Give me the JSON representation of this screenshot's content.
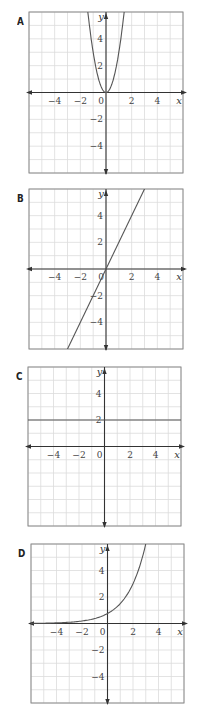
{
  "chart_data": [
    {
      "type": "line",
      "label": "A",
      "equation": "y = 3x^2",
      "xlabel": "x",
      "ylabel": "y",
      "xlim": [
        -6,
        6
      ],
      "ylim": [
        -6,
        6
      ],
      "xticks": [
        -4,
        -2,
        0,
        2,
        4
      ],
      "yticks": [
        4,
        2,
        -2,
        -4
      ],
      "grid": true,
      "series": [
        {
          "name": "curve",
          "kind": "parabola",
          "a": 3,
          "points": [
            [
              -1.41,
              6
            ],
            [
              -1,
              3
            ],
            [
              0,
              0
            ],
            [
              1,
              3
            ],
            [
              1.41,
              6
            ]
          ]
        }
      ]
    },
    {
      "type": "line",
      "label": "B",
      "equation": "y = 2x",
      "xlabel": "x",
      "ylabel": "y",
      "xlim": [
        -6,
        6
      ],
      "ylim": [
        -6,
        6
      ],
      "xticks": [
        -4,
        -2,
        0,
        2,
        4
      ],
      "yticks": [
        4,
        2,
        -2,
        -4
      ],
      "grid": true,
      "series": [
        {
          "name": "line",
          "kind": "linear",
          "m": 2,
          "c": 0,
          "points": [
            [
              -3,
              -6
            ],
            [
              0,
              0
            ],
            [
              3,
              6
            ]
          ]
        }
      ]
    },
    {
      "type": "line",
      "label": "C",
      "equation": "y = 2",
      "xlabel": "x",
      "ylabel": "y",
      "xlim": [
        -6,
        6
      ],
      "ylim": [
        -6,
        6
      ],
      "xticks": [
        -4,
        -2,
        0,
        2,
        4
      ],
      "yticks": [
        4,
        2
      ],
      "grid": true,
      "series": [
        {
          "name": "line",
          "kind": "linear",
          "m": 0,
          "c": 2,
          "points": [
            [
              -6,
              2
            ],
            [
              6,
              2
            ]
          ]
        }
      ]
    },
    {
      "type": "line",
      "label": "D",
      "equation": "y = 0.75 * 2^x",
      "xlabel": "x",
      "ylabel": "y",
      "xlim": [
        -6,
        6
      ],
      "ylim": [
        -6,
        6
      ],
      "xticks": [
        -4,
        -2,
        0,
        2,
        4
      ],
      "yticks": [
        4,
        2,
        -2,
        -4
      ],
      "grid": true,
      "series": [
        {
          "name": "curve",
          "kind": "exponential",
          "a": 0.75,
          "b": 2,
          "points": [
            [
              -6,
              0.01
            ],
            [
              -4,
              0.05
            ],
            [
              -2,
              0.19
            ],
            [
              0,
              0.75
            ],
            [
              1,
              1.5
            ],
            [
              2,
              3
            ],
            [
              3,
              6
            ]
          ]
        }
      ]
    }
  ],
  "panels": [
    {
      "label": "A",
      "top": 12,
      "left": 29,
      "right": 183,
      "bottom": 173,
      "label_x": 17,
      "label_y": 15
    },
    {
      "label": "B",
      "top": 189,
      "left": 29,
      "right": 183,
      "bottom": 349,
      "label_x": 17,
      "label_y": 192
    },
    {
      "label": "C",
      "top": 367,
      "left": 28,
      "right": 181,
      "bottom": 526,
      "label_x": 16,
      "label_y": 370
    },
    {
      "label": "D",
      "top": 544,
      "left": 31,
      "right": 184,
      "bottom": 703,
      "label_x": 18,
      "label_y": 547
    }
  ],
  "colors": {
    "grid": "#dcdcdc",
    "frame": "#8a8a8a",
    "axis": "#333333",
    "curve": "#555555"
  }
}
